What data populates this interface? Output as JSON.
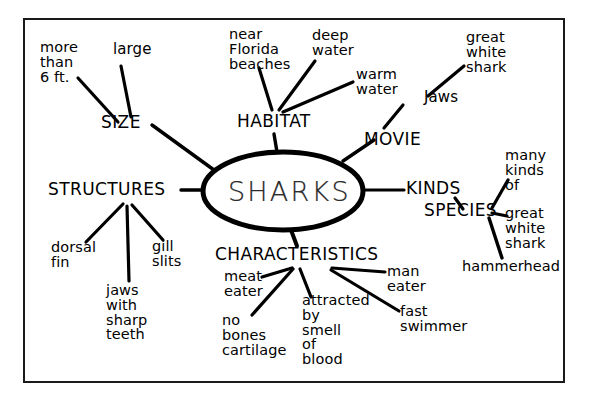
{
  "diagram": {
    "type": "mind-map",
    "title": "SHARKS",
    "frame": {
      "border_color": "#1a1a1a"
    },
    "ink_color": "#000000",
    "background_color": "#ffffff",
    "center": {
      "label": "SHARKS"
    },
    "branches": [
      {
        "label": "SIZE",
        "leaves": [
          {
            "label": "more\nthan\n6 ft."
          },
          {
            "label": "large"
          }
        ]
      },
      {
        "label": "HABITAT",
        "leaves": [
          {
            "label": "near\nFlorida\nbeaches"
          },
          {
            "label": "deep\nwater"
          },
          {
            "label": "warm\nwater"
          }
        ]
      },
      {
        "label": "MOVIE",
        "leaves": [
          {
            "label": "Jaws"
          },
          {
            "label": "great\nwhite\nshark"
          }
        ]
      },
      {
        "label": "KINDS",
        "leaves": [
          {
            "label": "SPECIES"
          },
          {
            "label": "many\nkinds\nof"
          },
          {
            "label": "great\nwhite\nshark"
          },
          {
            "label": "hammerhead"
          }
        ]
      },
      {
        "label": "CHARACTERISTICS",
        "leaves": [
          {
            "label": "meat\neater"
          },
          {
            "label": "no\nbones\ncartilage"
          },
          {
            "label": "attracted\nby\nsmell\nof\nblood"
          },
          {
            "label": "man\neater"
          },
          {
            "label": "fast\nswimmer"
          }
        ]
      },
      {
        "label": "STRUCTURES",
        "leaves": [
          {
            "label": "dorsal\nfin"
          },
          {
            "label": "jaws\nwith\nsharp\nteeth"
          },
          {
            "label": "gill\nslits"
          }
        ]
      }
    ]
  }
}
